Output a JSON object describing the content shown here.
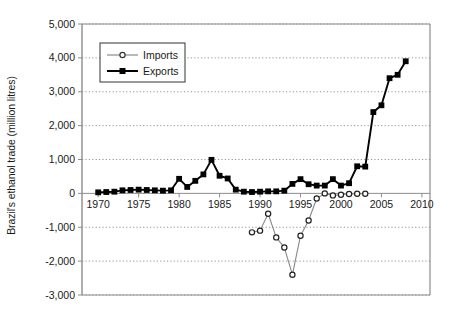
{
  "chart_data": {
    "type": "line",
    "title": "",
    "xlabel": "",
    "ylabel": "Brazil's ethanol trade (million litres)",
    "xlim": [
      1968,
      2011
    ],
    "ylim": [
      -3000,
      5000
    ],
    "xticks": [
      1970,
      1975,
      1980,
      1985,
      1990,
      1995,
      2000,
      2005,
      2010
    ],
    "xtick_labels": [
      "1970",
      "1975",
      "1980",
      "1985",
      "1990",
      "1995",
      "2000",
      "2005",
      "2010"
    ],
    "yticks": [
      -3000,
      -2000,
      -1000,
      0,
      1000,
      2000,
      3000,
      4000,
      5000
    ],
    "ytick_labels": [
      "-3,000",
      "-2,000",
      "-1,000",
      "0",
      "1,000",
      "2,000",
      "3,000",
      "4,000",
      "5,000"
    ],
    "grid": true,
    "grid_style": "dotted-horizontal",
    "legend_position": "upper-left-inside",
    "series": [
      {
        "name": "Imports",
        "marker": "open-circle",
        "color": "#888888",
        "x": [
          1989,
          1990,
          1991,
          1992,
          1993,
          1994,
          1995,
          1996,
          1997,
          1998,
          1999,
          2000,
          2001,
          2002,
          2003
        ],
        "values": [
          -1150,
          -1100,
          -600,
          -1300,
          -1600,
          -2400,
          -1250,
          -800,
          -150,
          0,
          -60,
          -40,
          -20,
          -10,
          -10
        ]
      },
      {
        "name": "Exports",
        "marker": "filled-square",
        "color": "#000000",
        "x": [
          1970,
          1971,
          1972,
          1973,
          1974,
          1975,
          1976,
          1977,
          1978,
          1979,
          1980,
          1981,
          1982,
          1983,
          1984,
          1985,
          1986,
          1987,
          1988,
          1989,
          1990,
          1991,
          1992,
          1993,
          1994,
          1995,
          1996,
          1997,
          1998,
          1999,
          2000,
          2001,
          2002,
          2003,
          2004,
          2005,
          2006,
          2007,
          2008
        ],
        "values": [
          30,
          40,
          50,
          90,
          100,
          110,
          100,
          90,
          80,
          90,
          430,
          190,
          370,
          560,
          990,
          520,
          440,
          110,
          50,
          40,
          50,
          60,
          60,
          80,
          280,
          420,
          270,
          230,
          230,
          420,
          230,
          300,
          800,
          790,
          2400,
          2600,
          3400,
          3500,
          3900
        ]
      }
    ]
  },
  "axis": {
    "y_title": "Brazil's ethanol trade (million litres)"
  },
  "legend": {
    "items": [
      {
        "label": "Imports"
      },
      {
        "label": "Exports"
      }
    ]
  }
}
